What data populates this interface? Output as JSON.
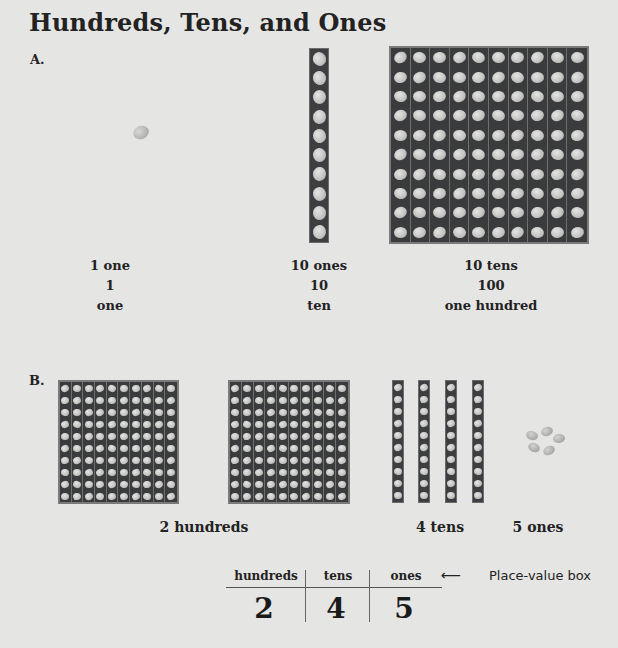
{
  "title": "Hundreds, Tens, and Ones",
  "section_a": {
    "label": "A.",
    "items": [
      {
        "name": "one",
        "line1": "1 one",
        "line2": "1",
        "line3": "one"
      },
      {
        "name": "ten",
        "line1": "10 ones",
        "line2": "10",
        "line3": "ten"
      },
      {
        "name": "hundred",
        "line1": "10 tens",
        "line2": "100",
        "line3": "one hundred"
      }
    ]
  },
  "section_b": {
    "label": "B.",
    "hundreds_label": "2 hundreds",
    "tens_label": "4 tens",
    "ones_label": "5 ones",
    "hundreds_count": 2,
    "tens_count": 4,
    "ones_count": 5
  },
  "place_value_box": {
    "headers": [
      "hundreds",
      "tens",
      "ones"
    ],
    "digits": [
      "2",
      "4",
      "5"
    ],
    "arrow": "⟵",
    "note": "Place-value box"
  },
  "colors": {
    "background": "#e5e5e4",
    "block": "#3a3b3c",
    "bean": "#c2c2c0"
  }
}
